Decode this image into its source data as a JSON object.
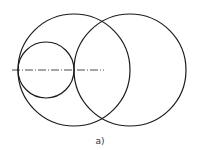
{
  "figure": {
    "caption": "a)",
    "stroke_color": "#1a1a1a",
    "circles": [
      {
        "name": "large-left-circle",
        "cx": 74,
        "cy": 70,
        "r": 56
      },
      {
        "name": "large-right-circle",
        "cx": 130,
        "cy": 70,
        "r": 56
      },
      {
        "name": "small-inner-circle",
        "cx": 46,
        "cy": 70,
        "r": 28
      }
    ],
    "centerline": {
      "style": "dash-dot",
      "x1": 12,
      "y1": 70,
      "x2": 104,
      "y2": 70
    }
  }
}
